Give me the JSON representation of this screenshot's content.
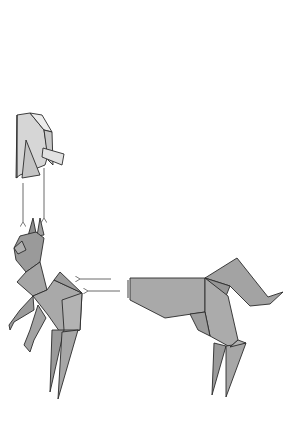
{
  "diagram": {
    "type": "origami-folding-instructions",
    "background": "#ffffff",
    "colors": {
      "paper_front": "#a9a9a9",
      "paper_dark": "#8f8f8f",
      "paper_light": "#d6d6d6",
      "paper_white": "#ececec",
      "outline": "#2a2a2a",
      "arrow": "#6a6a6a"
    },
    "elements": [
      {
        "id": "folded-flap-detail",
        "description": "Light gray paper flap, partially unfolded, shown above the head"
      },
      {
        "id": "down-arrows",
        "count": 2,
        "direction": "down",
        "description": "Two arrows pointing from the flap detail down to the animal's ears"
      },
      {
        "id": "rearing-animal",
        "description": "Completed origami animal (horse/cat-like) rearing on hind legs with pointed ears"
      },
      {
        "id": "left-arrows",
        "count": 2,
        "direction": "left",
        "description": "Two arrows pointing from the hindquarters model to the rearing animal"
      },
      {
        "id": "hindquarters-model",
        "description": "Origami rear body section with curled tail and two hind legs"
      }
    ]
  }
}
